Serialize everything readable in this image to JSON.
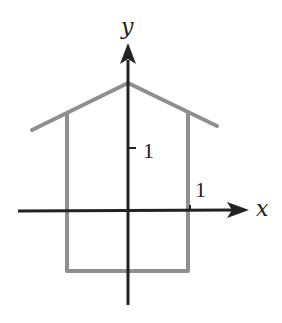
{
  "diagram": {
    "axes": {
      "x_label": "x",
      "y_label": "y",
      "x_tick_label": "1",
      "y_tick_label": "1",
      "axis_color": "#222222"
    },
    "shape": {
      "name": "house",
      "stroke_color": "#8f8f8f",
      "points_units": {
        "roof_left_eave": [
          -1.5,
          1.3
        ],
        "roof_peak": [
          0,
          2.1
        ],
        "roof_right_eave": [
          1.45,
          1.35
        ],
        "left_wall_top": [
          -1,
          1.6
        ],
        "left_wall_bottom": [
          -1,
          -1
        ],
        "right_wall_top": [
          1,
          1.6
        ],
        "right_wall_bottom": [
          1,
          -1
        ]
      }
    }
  }
}
